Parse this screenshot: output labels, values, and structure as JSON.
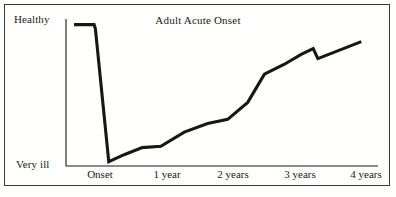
{
  "figure": {
    "background_color": "#fffffd",
    "frame_color": "#3a3a38",
    "line_color": "#171715"
  },
  "chart_data": {
    "type": "line",
    "title": "Adult Acute Onset",
    "xlabel": "",
    "ylabel": "",
    "grid": false,
    "legend": "none",
    "x_tick_labels": [
      "Onset",
      "1 year",
      "2 years",
      "3 years",
      "4 years"
    ],
    "x": [
      -0.3,
      0.0,
      0.02,
      0.22,
      0.45,
      0.72,
      1.0,
      1.35,
      1.7,
      2.0,
      2.3,
      2.55,
      2.85,
      3.1,
      3.28,
      3.35,
      4.0
    ],
    "y": [
      100,
      100,
      97,
      3,
      8,
      13,
      14,
      24,
      30,
      33,
      45,
      65,
      72,
      79,
      83,
      76,
      88
    ],
    "y_axis_labels": {
      "top": "Healthy",
      "bottom": "Very ill"
    },
    "ylim": [
      0,
      104
    ],
    "xlim": [
      -0.42,
      4.25
    ],
    "series": [
      {
        "name": "Adult Acute Onset",
        "points": [
          {
            "x": -0.3,
            "y": 100,
            "note": "healthy plateau start"
          },
          {
            "x": 0.0,
            "y": 100,
            "note": "healthy plateau end"
          },
          {
            "x": 0.02,
            "y": 97,
            "note": "onset of steep decline"
          },
          {
            "x": 0.22,
            "y": 3,
            "note": "trough - very ill"
          },
          {
            "x": 0.45,
            "y": 8
          },
          {
            "x": 0.72,
            "y": 13,
            "note": "low plateau start"
          },
          {
            "x": 1.0,
            "y": 14,
            "note": "low plateau at 1 year"
          },
          {
            "x": 1.35,
            "y": 24
          },
          {
            "x": 1.7,
            "y": 30,
            "note": "shallow plateau start"
          },
          {
            "x": 2.0,
            "y": 33,
            "note": "plateau at 2 years"
          },
          {
            "x": 2.3,
            "y": 45,
            "note": "steep recovery begins"
          },
          {
            "x": 2.55,
            "y": 65,
            "note": "knee of steep rise"
          },
          {
            "x": 2.85,
            "y": 72
          },
          {
            "x": 3.1,
            "y": 79
          },
          {
            "x": 3.28,
            "y": 83,
            "note": "local peak before relapse notch"
          },
          {
            "x": 3.35,
            "y": 76,
            "note": "relapse dip"
          },
          {
            "x": 4.0,
            "y": 88,
            "note": "final recovery level"
          }
        ]
      }
    ]
  }
}
